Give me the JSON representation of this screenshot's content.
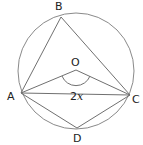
{
  "diagram": {
    "type": "circle-geometry",
    "circle": {
      "center_label": "O",
      "cx": 76,
      "cy": 71,
      "r": 58
    },
    "points": {
      "A": {
        "label": "A",
        "x": 21,
        "y": 93
      },
      "B": {
        "label": "B",
        "x": 61,
        "y": 17
      },
      "C": {
        "label": "C",
        "x": 130,
        "y": 95
      },
      "D": {
        "label": "D",
        "x": 77,
        "y": 128
      },
      "O": {
        "label": "O",
        "x": 76,
        "y": 70
      }
    },
    "segments": [
      "AB",
      "BC",
      "AO",
      "OC",
      "AD",
      "DC"
    ],
    "angle": {
      "vertex": "O",
      "label_num": "2",
      "label_var": "x"
    },
    "colors": {
      "stroke": "#7a7a7a",
      "text": "#222222",
      "background": "#ffffff"
    }
  }
}
